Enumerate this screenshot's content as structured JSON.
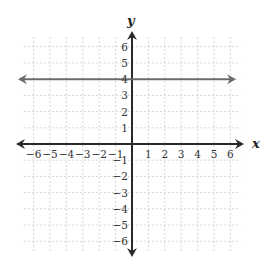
{
  "chart_data": {
    "type": "line",
    "title": "",
    "xlabel": "x",
    "ylabel": "y",
    "xlim": [
      -6,
      6
    ],
    "ylim": [
      -6,
      6
    ],
    "grid": true,
    "x_ticks": [
      "-6",
      "-5",
      "-4",
      "-3",
      "-2",
      "-1",
      "1",
      "2",
      "3",
      "4",
      "5",
      "6"
    ],
    "y_ticks": [
      "6",
      "5",
      "4",
      "3",
      "2",
      "1",
      "-1",
      "-2",
      "-3",
      "-4",
      "-5",
      "-6"
    ],
    "series": [
      {
        "name": "y = 4",
        "equation": "y = 4",
        "x": [
          -6.5,
          6.5
        ],
        "y": [
          4,
          4
        ],
        "color": "#6b6b6b",
        "arrows": "both"
      }
    ]
  },
  "colors": {
    "axis": "#2a2a2a",
    "line": "#6b6b6b",
    "grid": "#c8c8c8"
  }
}
